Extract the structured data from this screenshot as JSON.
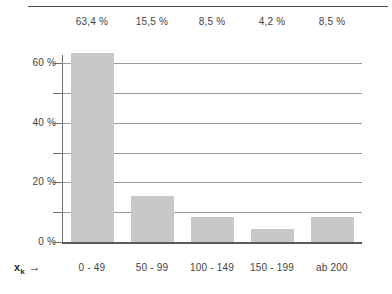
{
  "chart_data": {
    "type": "bar",
    "title": "",
    "subtitle": "",
    "xlabel": "x",
    "xlabel_subscript": "k",
    "xlabel_arrow": "→",
    "ylabel": "",
    "categories": [
      "0 - 49",
      "50 - 99",
      "100 - 149",
      "150 - 199",
      "ab 200"
    ],
    "values": [
      63.4,
      15.5,
      8.5,
      4.2,
      8.5
    ],
    "data_labels": [
      "63,4 %",
      "15,5 %",
      "8,5 %",
      "4,2 %",
      "8,5 %"
    ],
    "ylim": [
      0,
      63.4
    ],
    "y_ticks": [
      0,
      10,
      20,
      30,
      40,
      50,
      60
    ],
    "y_tick_labels": [
      "0 %",
      "",
      "20 %",
      "",
      "40 %",
      "",
      "60 %"
    ],
    "y_major_labels": [
      {
        "value": 60,
        "text": "60 %"
      },
      {
        "value": 40,
        "text": "40 %"
      },
      {
        "value": 20,
        "text": "20 %"
      },
      {
        "value": 0,
        "text": "0 %"
      }
    ],
    "gridlines": [
      10,
      20,
      30,
      40,
      50,
      60
    ],
    "grid": true,
    "legend": null,
    "legend_position": "none",
    "bar_color": "#c8c8c8",
    "gridline_color": "#9a9a9a",
    "axis_color": "#5a5a5a",
    "text_color": "#3f3f3f",
    "background_color": "#ffffff"
  },
  "decorations": {
    "top_rule_color": "#4a4a4a"
  }
}
